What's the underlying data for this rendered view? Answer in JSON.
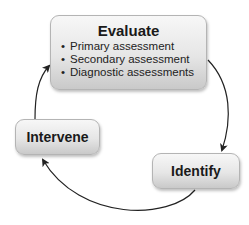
{
  "diagram": {
    "type": "cycle",
    "nodes": {
      "evaluate": {
        "title": "Evaluate",
        "items": [
          "Primary assessment",
          "Secondary assessment",
          "Diagnostic assessments"
        ],
        "bullet": "•"
      },
      "identify": {
        "title": "Identify"
      },
      "intervene": {
        "title": "Intervene"
      }
    },
    "edges": [
      {
        "from": "Evaluate",
        "to": "Identify"
      },
      {
        "from": "Identify",
        "to": "Intervene"
      },
      {
        "from": "Intervene",
        "to": "Evaluate"
      }
    ],
    "colors": {
      "box_top": "#f7f7f7",
      "box_bottom": "#c9c9c9",
      "border": "#b4b4b4",
      "arrow": "#222222"
    }
  }
}
